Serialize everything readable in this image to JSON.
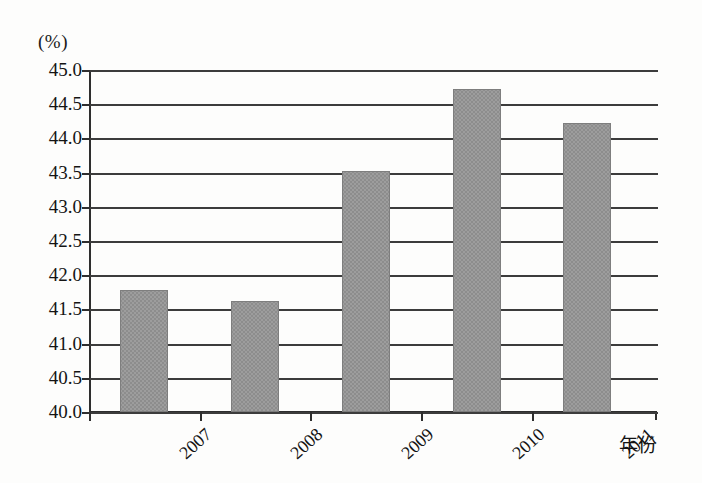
{
  "chart_data": {
    "type": "bar",
    "title": "",
    "subtitle": "",
    "unit_label": "(%)",
    "xlabel": "年份",
    "ylabel": "",
    "categories": [
      "2007",
      "2008",
      "2009",
      "2010",
      "2011"
    ],
    "values": [
      41.79,
      41.62,
      43.52,
      44.72,
      44.23
    ],
    "ylim": [
      40.0,
      45.0
    ],
    "ytick_step": 0.5,
    "ytick_labels": [
      "45.0",
      "44.5",
      "44.0",
      "43.5",
      "43.0",
      "42.5",
      "42.0",
      "41.5",
      "41.0",
      "40.5",
      "40.0"
    ],
    "ytick_values": [
      45.0,
      44.5,
      44.0,
      43.5,
      43.0,
      42.5,
      42.0,
      41.5,
      41.0,
      40.5,
      40.0
    ],
    "grid": true,
    "grid_axis": "y",
    "legend": false,
    "legend_position": "none",
    "series": [
      {
        "name": "",
        "values": [
          41.79,
          41.62,
          43.52,
          44.72,
          44.23
        ]
      }
    ],
    "annotations": [],
    "colors": {
      "bar_fill": "#9d9d9d",
      "bar_pattern": "#8d8d8d",
      "bar_outline": "#7e7e7e",
      "gridline": "#3c3c3c",
      "axis": "#2e2e2e",
      "text": "#141414",
      "background": "#fdfdfc"
    }
  }
}
